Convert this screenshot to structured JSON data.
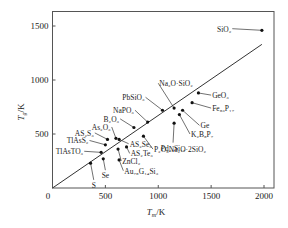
{
  "chart_data": {
    "type": "scatter",
    "title": "",
    "xlabel": "T_m/K",
    "ylabel": "T_g/K",
    "xlim": [
      0,
      2000
    ],
    "ylim": [
      0,
      1600
    ],
    "x_ticks": [
      0,
      500,
      1000,
      1500,
      2000
    ],
    "y_ticks": [
      500,
      1000,
      1500
    ],
    "origin_label": "0",
    "grid": false,
    "legend": null,
    "reference_line": {
      "label": "T_g = 2/3 T_m",
      "x": [
        0,
        1980
      ],
      "y": [
        0,
        1330
      ]
    },
    "points": [
      {
        "name": "SiO₂",
        "x": 1980,
        "y": 1460,
        "lx": 1700,
        "ly": 1475,
        "anchor": "end"
      },
      {
        "name": "Na₂O·SiO₂",
        "x": 1150,
        "y": 740,
        "lx": 1000,
        "ly": 970,
        "anchor": "start"
      },
      {
        "name": "PbSiO₃",
        "x": 1040,
        "y": 720,
        "lx": 880,
        "ly": 840,
        "anchor": "end"
      },
      {
        "name": "GeO₃",
        "x": 1380,
        "y": 880,
        "lx": 1500,
        "ly": 860,
        "anchor": "start"
      },
      {
        "name": "NaPO₃",
        "x": 900,
        "y": 610,
        "lx": 780,
        "ly": 720,
        "anchor": "end"
      },
      {
        "name": "Fe₈₃P₁₇",
        "x": 1320,
        "y": 790,
        "lx": 1500,
        "ly": 740,
        "anchor": "start"
      },
      {
        "name": "B₂O₃",
        "x": 770,
        "y": 560,
        "lx": 640,
        "ly": 640,
        "anchor": "end"
      },
      {
        "name": "Ge",
        "x": 1230,
        "y": 720,
        "lx": 1390,
        "ly": 580,
        "anchor": "start"
      },
      {
        "name": "As₂O₃",
        "x": 600,
        "y": 460,
        "lx": 560,
        "ly": 565,
        "anchor": "end"
      },
      {
        "name": "K₂B₈P₇",
        "x": 1200,
        "y": 680,
        "lx": 1300,
        "ly": 500,
        "anchor": "start"
      },
      {
        "name": "AS₂S₃",
        "x": 520,
        "y": 450,
        "lx": 400,
        "ly": 510,
        "anchor": "end"
      },
      {
        "name": "Pd₂₃Si₁₇",
        "x": 1150,
        "y": 600,
        "lx": 1140,
        "ly": 420,
        "anchor": "middle"
      },
      {
        "name": "TlAsS₂",
        "x": 500,
        "y": 400,
        "lx": 350,
        "ly": 440,
        "anchor": "end"
      },
      {
        "name": "AS₂Se₃",
        "x": 630,
        "y": 450,
        "lx": 720,
        "ly": 410,
        "anchor": "start"
      },
      {
        "name": "P₂O₅Na₂O·2SiO₂",
        "x": 860,
        "y": 480,
        "lx": 950,
        "ly": 360,
        "anchor": "start"
      },
      {
        "name": "AS₂Te₃",
        "x": 700,
        "y": 380,
        "lx": 730,
        "ly": 320,
        "anchor": "start"
      },
      {
        "name": "TlAsTO₃",
        "x": 460,
        "y": 330,
        "lx": 300,
        "ly": 340,
        "anchor": "end"
      },
      {
        "name": "ZnCl₂",
        "x": 620,
        "y": 360,
        "lx": 650,
        "ly": 250,
        "anchor": "start"
      },
      {
        "name": "Au₇₈G₁₄Si₃",
        "x": 630,
        "y": 260,
        "lx": 670,
        "ly": 160,
        "anchor": "start"
      },
      {
        "name": "Se",
        "x": 480,
        "y": 270,
        "lx": 500,
        "ly": 165,
        "anchor": "middle"
      },
      {
        "name": "S",
        "x": 360,
        "y": 230,
        "lx": 390,
        "ly": 75,
        "anchor": "middle"
      }
    ]
  }
}
